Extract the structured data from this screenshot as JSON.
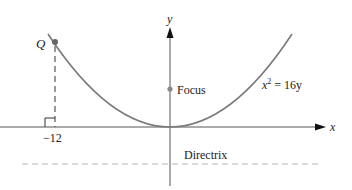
{
  "diagram": {
    "axes": {
      "x_label": "x",
      "y_label": "y"
    },
    "curve": {
      "equation_lhs": "x",
      "equation_exp": "2",
      "equation_rhs": " = 16y",
      "color": "#7a7a7a"
    },
    "point_q": {
      "label": "Q",
      "x_value": -12
    },
    "tick_label": "−12",
    "focus": {
      "label": "Focus",
      "y_value": 4
    },
    "directrix": {
      "label": "Directrix",
      "y_value": -4,
      "color": "#b0b0b0"
    }
  }
}
